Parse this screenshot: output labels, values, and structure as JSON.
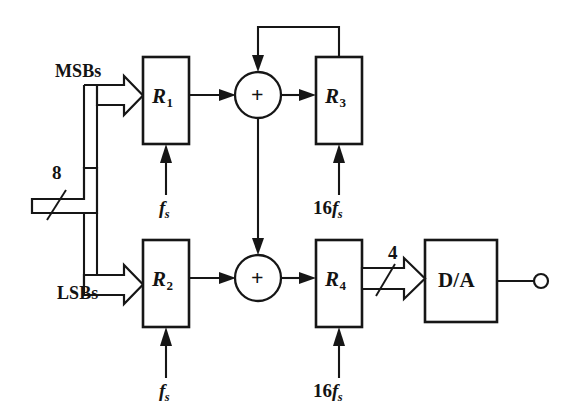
{
  "figure": {
    "kind": "block-diagram",
    "background_color": "#ffffff",
    "ink_color": "#161616"
  },
  "blocks": [
    {
      "id": "R1",
      "label": "R",
      "subscript": "1",
      "x": 143,
      "y": 57,
      "w": 46,
      "h": 87
    },
    {
      "id": "R3",
      "label": "R",
      "subscript": "3",
      "x": 316,
      "y": 57,
      "w": 46,
      "h": 87
    },
    {
      "id": "R2",
      "label": "R",
      "subscript": "2",
      "x": 143,
      "y": 240,
      "w": 46,
      "h": 87
    },
    {
      "id": "R4",
      "label": "R",
      "subscript": "4",
      "x": 316,
      "y": 240,
      "w": 46,
      "h": 87
    },
    {
      "id": "DA",
      "label": "D/A",
      "subscript": "",
      "x": 425,
      "y": 240,
      "w": 72,
      "h": 82
    }
  ],
  "adders": [
    {
      "id": "sum-top",
      "symbol": "+",
      "cx": 258,
      "cy": 95
    },
    {
      "id": "sum-bottom",
      "symbol": "+",
      "cx": 258,
      "cy": 278
    }
  ],
  "signal_labels": {
    "msb": "MSBs",
    "lsb": "LSBs",
    "input_bus_width": "8",
    "dac_bus_width": "4"
  },
  "clocks": [
    {
      "for": "R1",
      "prefix": "",
      "symbol": "f",
      "subscript": "s"
    },
    {
      "for": "R3",
      "prefix": "16",
      "symbol": "f",
      "subscript": "s"
    },
    {
      "for": "R2",
      "prefix": "",
      "symbol": "f",
      "subscript": "s"
    },
    {
      "for": "R4",
      "prefix": "16",
      "symbol": "f",
      "subscript": "s"
    }
  ],
  "clock_text": {
    "fs_prefix_empty": "",
    "fs_symbol": "f",
    "fs_subscript": "s",
    "sixteen": "16"
  },
  "output": {
    "terminal": "open-circle",
    "cx": 541,
    "cy": 281
  }
}
